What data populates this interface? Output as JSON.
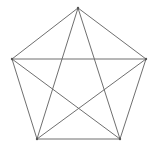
{
  "diagram": {
    "type": "complete-graph-k5",
    "colors": {
      "background": "#ffffff",
      "edge": "#6f6f6f",
      "vertex": "#555555"
    },
    "vertices": [
      {
        "id": "top",
        "x": 78,
        "y": 8
      },
      {
        "id": "right",
        "x": 146,
        "y": 59
      },
      {
        "id": "bottom-right",
        "x": 120,
        "y": 139
      },
      {
        "id": "bottom-left",
        "x": 37,
        "y": 139
      },
      {
        "id": "left",
        "x": 12,
        "y": 59
      }
    ],
    "edges": [
      {
        "from": 0,
        "to": 1,
        "kind": "side"
      },
      {
        "from": 1,
        "to": 2,
        "kind": "side"
      },
      {
        "from": 2,
        "to": 3,
        "kind": "side"
      },
      {
        "from": 3,
        "to": 4,
        "kind": "side"
      },
      {
        "from": 4,
        "to": 0,
        "kind": "side"
      },
      {
        "from": 0,
        "to": 2,
        "kind": "diagonal"
      },
      {
        "from": 0,
        "to": 3,
        "kind": "diagonal"
      },
      {
        "from": 1,
        "to": 3,
        "kind": "diagonal"
      },
      {
        "from": 1,
        "to": 4,
        "kind": "diagonal"
      },
      {
        "from": 2,
        "to": 4,
        "kind": "diagonal"
      }
    ]
  }
}
